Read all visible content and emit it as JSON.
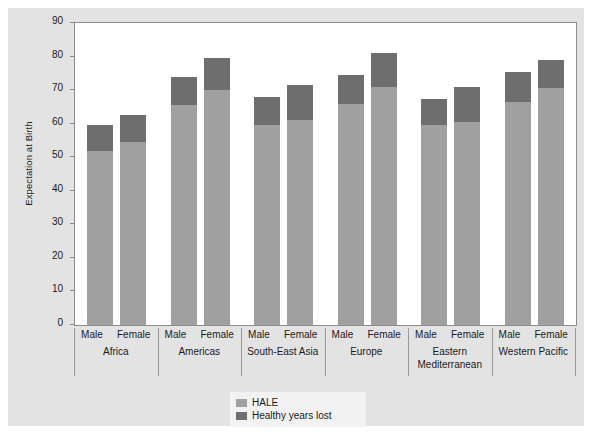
{
  "chart_data": {
    "type": "bar",
    "subtype": "stacked",
    "title": "",
    "xlabel": "",
    "ylabel": "Expectation at Birth",
    "ylim": [
      0,
      90
    ],
    "yticks": [
      0,
      10,
      20,
      30,
      40,
      50,
      60,
      70,
      80,
      90
    ],
    "ytick_labels": [
      "0",
      "10",
      "20",
      "30",
      "40",
      "50",
      "60",
      "70",
      "80",
      "90"
    ],
    "grid": false,
    "legend_position": "bottom-center",
    "legend": [
      "HALE",
      "Healthy years lost"
    ],
    "series": [
      {
        "name": "HALE",
        "color": "#a0a0a0",
        "values": [
          52.0,
          54.5,
          65.5,
          70.0,
          59.5,
          61.0,
          66.0,
          71.0,
          59.5,
          60.5,
          66.5,
          70.5
        ]
      },
      {
        "name": "Healthy years lost",
        "color": "#6e6e6e",
        "values": [
          7.5,
          8.0,
          8.5,
          9.5,
          8.5,
          10.5,
          8.5,
          10.0,
          8.0,
          10.5,
          9.0,
          8.5
        ]
      }
    ],
    "totals": [
      59.5,
      62.5,
      74.0,
      79.5,
      68.0,
      71.5,
      74.5,
      81.0,
      67.5,
      71.0,
      75.5,
      79.0
    ],
    "categories": [
      "Africa Male",
      "Africa Female",
      "Americas Male",
      "Americas Female",
      "South-East Asia Male",
      "South-East Asia Female",
      "Europe Male",
      "Europe Female",
      "Eastern Mediterranean Male",
      "Eastern Mediterranean Female",
      "Western Pacific Male",
      "Western Pacific Female"
    ],
    "groups": [
      {
        "label": "Africa",
        "bars": [
          {
            "sex": "Male",
            "hale": 52.0,
            "lost": 7.5,
            "total": 59.5
          },
          {
            "sex": "Female",
            "hale": 54.5,
            "lost": 8.0,
            "total": 62.5
          }
        ]
      },
      {
        "label": "Americas",
        "bars": [
          {
            "sex": "Male",
            "hale": 65.5,
            "lost": 8.5,
            "total": 74.0
          },
          {
            "sex": "Female",
            "hale": 70.0,
            "lost": 9.5,
            "total": 79.5
          }
        ]
      },
      {
        "label": "South-East Asia",
        "bars": [
          {
            "sex": "Male",
            "hale": 59.5,
            "lost": 8.5,
            "total": 68.0
          },
          {
            "sex": "Female",
            "hale": 61.0,
            "lost": 10.5,
            "total": 71.5
          }
        ]
      },
      {
        "label": "Europe",
        "bars": [
          {
            "sex": "Male",
            "hale": 66.0,
            "lost": 8.5,
            "total": 74.5
          },
          {
            "sex": "Female",
            "hale": 71.0,
            "lost": 10.0,
            "total": 81.0
          }
        ]
      },
      {
        "label": "Eastern\nMediterranean",
        "bars": [
          {
            "sex": "Male",
            "hale": 59.5,
            "lost": 8.0,
            "total": 67.5
          },
          {
            "sex": "Female",
            "hale": 60.5,
            "lost": 10.5,
            "total": 71.0
          }
        ]
      },
      {
        "label": "Western Pacific",
        "bars": [
          {
            "sex": "Male",
            "hale": 66.5,
            "lost": 9.0,
            "total": 75.5
          },
          {
            "sex": "Female",
            "hale": 70.5,
            "lost": 8.5,
            "total": 79.0
          }
        ]
      }
    ]
  },
  "colors": {
    "hale": "#a0a0a0",
    "lost": "#6e6e6e",
    "paper": "#e3e3e3",
    "plot_bg": "#ffffff",
    "axis": "#8c8c8c",
    "text": "#1b1b1b"
  },
  "legend": {
    "items": [
      {
        "label": "HALE",
        "color": "#a0a0a0"
      },
      {
        "label": "Healthy years lost",
        "color": "#6e6e6e"
      }
    ]
  }
}
